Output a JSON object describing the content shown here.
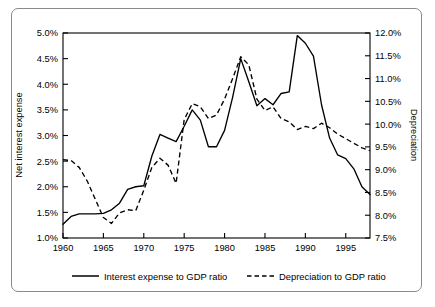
{
  "chart_data": {
    "type": "line",
    "title": "",
    "subtitle": "",
    "xlabel": "",
    "ylabel": "Net interest expense",
    "y2label": "Depreciation",
    "xlim": [
      1960,
      1998
    ],
    "ylim": [
      1.0,
      5.0
    ],
    "y2lim": [
      7.5,
      12.0
    ],
    "grid": false,
    "legend_position": "bottom",
    "x_ticklabels": [
      "1960",
      "1965",
      "1970",
      "1975",
      "1980",
      "1985",
      "1990",
      "1995"
    ],
    "x_tickvalues": [
      1960,
      1965,
      1970,
      1975,
      1980,
      1985,
      1990,
      1995
    ],
    "y_ticklabels": [
      "1.0%",
      "1.5%",
      "2.0%",
      "2.5%",
      "3.0%",
      "3.5%",
      "4.0%",
      "4.5%",
      "5.0%"
    ],
    "y_tickvalues": [
      1.0,
      1.5,
      2.0,
      2.5,
      3.0,
      3.5,
      4.0,
      4.5,
      5.0
    ],
    "y2_ticklabels": [
      "7.5%",
      "8.0%",
      "8.5%",
      "9.0%",
      "9.5%",
      "10.0%",
      "10.5%",
      "11.0%",
      "11.5%",
      "12.0%"
    ],
    "y2_tickvalues": [
      7.5,
      8.0,
      8.5,
      9.0,
      9.5,
      10.0,
      10.5,
      11.0,
      11.5,
      12.0
    ],
    "x": [
      1960,
      1961,
      1962,
      1963,
      1964,
      1965,
      1966,
      1967,
      1968,
      1969,
      1970,
      1971,
      1972,
      1973,
      1974,
      1975,
      1976,
      1977,
      1978,
      1979,
      1980,
      1981,
      1982,
      1983,
      1984,
      1985,
      1986,
      1987,
      1988,
      1989,
      1990,
      1991,
      1992,
      1993,
      1994,
      1995,
      1996,
      1997,
      1998
    ],
    "series": [
      {
        "name": "Interest expense to GDP ratio",
        "axis": "left",
        "style": "solid",
        "color": "#000000",
        "unit": "%",
        "values": [
          1.27,
          1.42,
          1.47,
          1.47,
          1.47,
          1.48,
          1.55,
          1.68,
          1.82,
          2.0,
          2.02,
          2.58,
          3.02,
          2.95,
          2.88,
          2.85,
          3.08,
          3.32,
          3.5,
          3.25,
          3.27,
          3.3,
          3.23,
          3.24,
          3.47,
          4.06,
          4.5,
          4.2,
          4.05,
          4.12,
          4.2,
          4.55,
          4.95,
          4.87,
          4.5,
          3.7,
          3.03,
          2.55,
          2.4
        ]
      },
      {
        "name": "Depreciation to GDP ratio",
        "axis": "right",
        "style": "dashed",
        "color": "#000000",
        "unit": "%",
        "values": [
          9.23,
          9.2,
          9.1,
          8.9,
          8.6,
          8.3,
          7.8,
          7.72,
          7.8,
          7.95,
          8.0,
          8.1,
          8.3,
          8.65,
          9.15,
          9.5,
          9.45,
          9.2,
          8.95,
          9.55,
          10.3,
          10.65,
          10.9,
          11.2,
          11.52,
          11.3,
          11.4,
          11.05,
          10.7,
          10.55,
          10.65,
          10.4,
          10.15,
          10.05,
          10.1,
          10.02,
          10.17,
          10.05,
          9.9
        ]
      }
    ],
    "series_left_detail": {
      "name": "Interest expense to GDP ratio",
      "points": [
        {
          "x": 1960,
          "y": 1.27
        },
        {
          "x": 1961,
          "y": 1.42
        },
        {
          "x": 1962,
          "y": 1.47
        },
        {
          "x": 1963,
          "y": 1.47
        },
        {
          "x": 1964,
          "y": 1.47
        },
        {
          "x": 1965,
          "y": 1.48
        },
        {
          "x": 1966,
          "y": 1.55
        },
        {
          "x": 1967,
          "y": 1.68
        },
        {
          "x": 1968,
          "y": 1.95
        },
        {
          "x": 1969,
          "y": 2.0
        },
        {
          "x": 1970,
          "y": 2.02
        },
        {
          "x": 1971,
          "y": 2.6
        },
        {
          "x": 1972,
          "y": 3.02
        },
        {
          "x": 1973,
          "y": 2.95
        },
        {
          "x": 1974,
          "y": 2.88
        },
        {
          "x": 1975,
          "y": 3.18
        },
        {
          "x": 1976,
          "y": 3.5
        },
        {
          "x": 1977,
          "y": 3.3
        },
        {
          "x": 1978,
          "y": 2.78
        },
        {
          "x": 1979,
          "y": 2.78
        },
        {
          "x": 1980,
          "y": 3.1
        },
        {
          "x": 1981,
          "y": 3.75
        },
        {
          "x": 1982,
          "y": 4.5
        },
        {
          "x": 1983,
          "y": 4.05
        },
        {
          "x": 1984,
          "y": 3.58
        },
        {
          "x": 1985,
          "y": 3.72
        },
        {
          "x": 1986,
          "y": 3.6
        },
        {
          "x": 1987,
          "y": 3.82
        },
        {
          "x": 1988,
          "y": 3.85
        },
        {
          "x": 1989,
          "y": 4.95
        },
        {
          "x": 1990,
          "y": 4.8
        },
        {
          "x": 1991,
          "y": 4.55
        },
        {
          "x": 1992,
          "y": 3.6
        },
        {
          "x": 1993,
          "y": 2.95
        },
        {
          "x": 1994,
          "y": 2.62
        },
        {
          "x": 1995,
          "y": 2.55
        },
        {
          "x": 1996,
          "y": 2.35
        },
        {
          "x": 1997,
          "y": 2.0
        },
        {
          "x": 1998,
          "y": 1.85
        }
      ]
    },
    "series_right_detail": {
      "name": "Depreciation to GDP ratio",
      "points": [
        {
          "x": 1960,
          "y": 9.22
        },
        {
          "x": 1961,
          "y": 9.2
        },
        {
          "x": 1962,
          "y": 9.05
        },
        {
          "x": 1963,
          "y": 8.75
        },
        {
          "x": 1964,
          "y": 8.35
        },
        {
          "x": 1965,
          "y": 7.95
        },
        {
          "x": 1966,
          "y": 7.82
        },
        {
          "x": 1967,
          "y": 8.05
        },
        {
          "x": 1968,
          "y": 8.12
        },
        {
          "x": 1969,
          "y": 8.1
        },
        {
          "x": 1970,
          "y": 8.55
        },
        {
          "x": 1971,
          "y": 9.05
        },
        {
          "x": 1972,
          "y": 9.25
        },
        {
          "x": 1973,
          "y": 9.1
        },
        {
          "x": 1974,
          "y": 8.7
        },
        {
          "x": 1975,
          "y": 10.1
        },
        {
          "x": 1976,
          "y": 10.45
        },
        {
          "x": 1977,
          "y": 10.38
        },
        {
          "x": 1978,
          "y": 10.12
        },
        {
          "x": 1979,
          "y": 10.2
        },
        {
          "x": 1980,
          "y": 10.55
        },
        {
          "x": 1981,
          "y": 11.0
        },
        {
          "x": 1982,
          "y": 11.48
        },
        {
          "x": 1983,
          "y": 11.3
        },
        {
          "x": 1984,
          "y": 10.55
        },
        {
          "x": 1985,
          "y": 10.3
        },
        {
          "x": 1986,
          "y": 10.38
        },
        {
          "x": 1987,
          "y": 10.12
        },
        {
          "x": 1988,
          "y": 10.05
        },
        {
          "x": 1989,
          "y": 9.88
        },
        {
          "x": 1990,
          "y": 9.95
        },
        {
          "x": 1991,
          "y": 9.9
        },
        {
          "x": 1992,
          "y": 10.02
        },
        {
          "x": 1993,
          "y": 9.92
        },
        {
          "x": 1994,
          "y": 9.78
        },
        {
          "x": 1995,
          "y": 9.68
        },
        {
          "x": 1996,
          "y": 9.58
        },
        {
          "x": 1997,
          "y": 9.48
        },
        {
          "x": 1998,
          "y": 9.42
        }
      ]
    },
    "legend": [
      {
        "label": "Interest expense to GDP ratio",
        "style": "solid"
      },
      {
        "label": "Depreciation to GDP ratio",
        "style": "dashed"
      }
    ]
  }
}
